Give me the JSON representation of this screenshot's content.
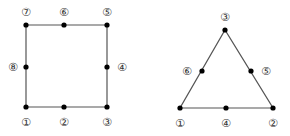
{
  "diagram": {
    "colors": {
      "edge": "#555555",
      "node": "#000000",
      "label": "#333333",
      "background": "#ffffff"
    },
    "quad": {
      "name": "8-node quadrilateral element",
      "edges": [
        [
          1,
          3
        ],
        [
          3,
          5
        ],
        [
          5,
          7
        ],
        [
          7,
          1
        ]
      ],
      "nodes": [
        {
          "id": 1,
          "label": "①",
          "x": 26,
          "y": 107,
          "lx": 26,
          "ly": 122
        },
        {
          "id": 2,
          "label": "②",
          "x": 64,
          "y": 107,
          "lx": 64,
          "ly": 122
        },
        {
          "id": 3,
          "label": "③",
          "x": 107,
          "y": 107,
          "lx": 107,
          "ly": 122
        },
        {
          "id": 4,
          "label": "④",
          "x": 107,
          "y": 67,
          "lx": 122,
          "ly": 67
        },
        {
          "id": 5,
          "label": "⑤",
          "x": 107,
          "y": 25,
          "lx": 107,
          "ly": 12
        },
        {
          "id": 6,
          "label": "⑥",
          "x": 64,
          "y": 25,
          "lx": 64,
          "ly": 12
        },
        {
          "id": 7,
          "label": "⑦",
          "x": 26,
          "y": 25,
          "lx": 26,
          "ly": 12
        },
        {
          "id": 8,
          "label": "⑧",
          "x": 26,
          "y": 67,
          "lx": 13,
          "ly": 67
        }
      ]
    },
    "tri": {
      "name": "6-node triangular element",
      "nodes": [
        {
          "id": 1,
          "label": "①",
          "x": 180,
          "y": 108,
          "lx": 180,
          "ly": 123
        },
        {
          "id": 2,
          "label": "②",
          "x": 273,
          "y": 108,
          "lx": 273,
          "ly": 123
        },
        {
          "id": 3,
          "label": "③",
          "x": 225,
          "y": 30,
          "lx": 225,
          "ly": 17
        },
        {
          "id": 4,
          "label": "④",
          "x": 226,
          "y": 108,
          "lx": 226,
          "ly": 123
        },
        {
          "id": 5,
          "label": "⑤",
          "x": 251,
          "y": 71,
          "lx": 266,
          "ly": 71
        },
        {
          "id": 6,
          "label": "⑥",
          "x": 202,
          "y": 71,
          "lx": 187,
          "ly": 71
        }
      ]
    }
  }
}
